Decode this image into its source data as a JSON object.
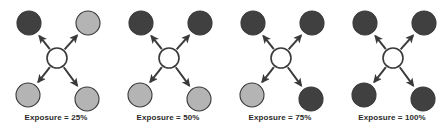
{
  "figure": {
    "type": "node-link-diagram-series",
    "width": 447,
    "height": 136,
    "background_color": "#ffffff"
  },
  "legend_colors": {
    "exposed_node_fill": "#404040",
    "unexposed_node_fill": "#b4b4b4",
    "node_stroke": "#3a3a3a",
    "center_node_fill": "#ffffff",
    "arrow_color": "#3a3a3a",
    "label_color": "#2b2b2b"
  },
  "geometry": {
    "center_node": {
      "cx": 57,
      "cy": 58,
      "r": 10
    },
    "peripheral_radius": 12,
    "peripheral_positions": [
      {
        "id": "top-left",
        "cx": 29,
        "cy": 23
      },
      {
        "id": "top-right",
        "cx": 88,
        "cy": 23
      },
      {
        "id": "bottom-left",
        "cx": 28,
        "cy": 95
      },
      {
        "id": "bottom-right",
        "cx": 87,
        "cy": 99
      }
    ]
  },
  "panels": [
    {
      "id": "panel-25",
      "x": 0,
      "label": "Exposure = 25%",
      "exposure_percent": 25,
      "exposed_count": 1,
      "total_count": 4,
      "nodes": [
        {
          "position": "top-left",
          "state": "exposed"
        },
        {
          "position": "top-right",
          "state": "unexposed"
        },
        {
          "position": "bottom-left",
          "state": "unexposed"
        },
        {
          "position": "bottom-right",
          "state": "unexposed"
        }
      ]
    },
    {
      "id": "panel-50",
      "x": 112,
      "label": "Exposure = 50%",
      "exposure_percent": 50,
      "exposed_count": 2,
      "total_count": 4,
      "nodes": [
        {
          "position": "top-left",
          "state": "exposed"
        },
        {
          "position": "top-right",
          "state": "exposed"
        },
        {
          "position": "bottom-left",
          "state": "unexposed"
        },
        {
          "position": "bottom-right",
          "state": "unexposed"
        }
      ]
    },
    {
      "id": "panel-75",
      "x": 224,
      "label": "Exposure = 75%",
      "exposure_percent": 75,
      "exposed_count": 3,
      "total_count": 4,
      "nodes": [
        {
          "position": "top-left",
          "state": "exposed"
        },
        {
          "position": "top-right",
          "state": "exposed"
        },
        {
          "position": "bottom-left",
          "state": "unexposed"
        },
        {
          "position": "bottom-right",
          "state": "exposed"
        }
      ]
    },
    {
      "id": "panel-100",
      "x": 336,
      "label": "Exposure = 100%",
      "exposure_percent": 100,
      "exposed_count": 4,
      "total_count": 4,
      "nodes": [
        {
          "position": "top-left",
          "state": "exposed"
        },
        {
          "position": "top-right",
          "state": "exposed"
        },
        {
          "position": "bottom-left",
          "state": "exposed"
        },
        {
          "position": "bottom-right",
          "state": "exposed"
        }
      ]
    }
  ]
}
